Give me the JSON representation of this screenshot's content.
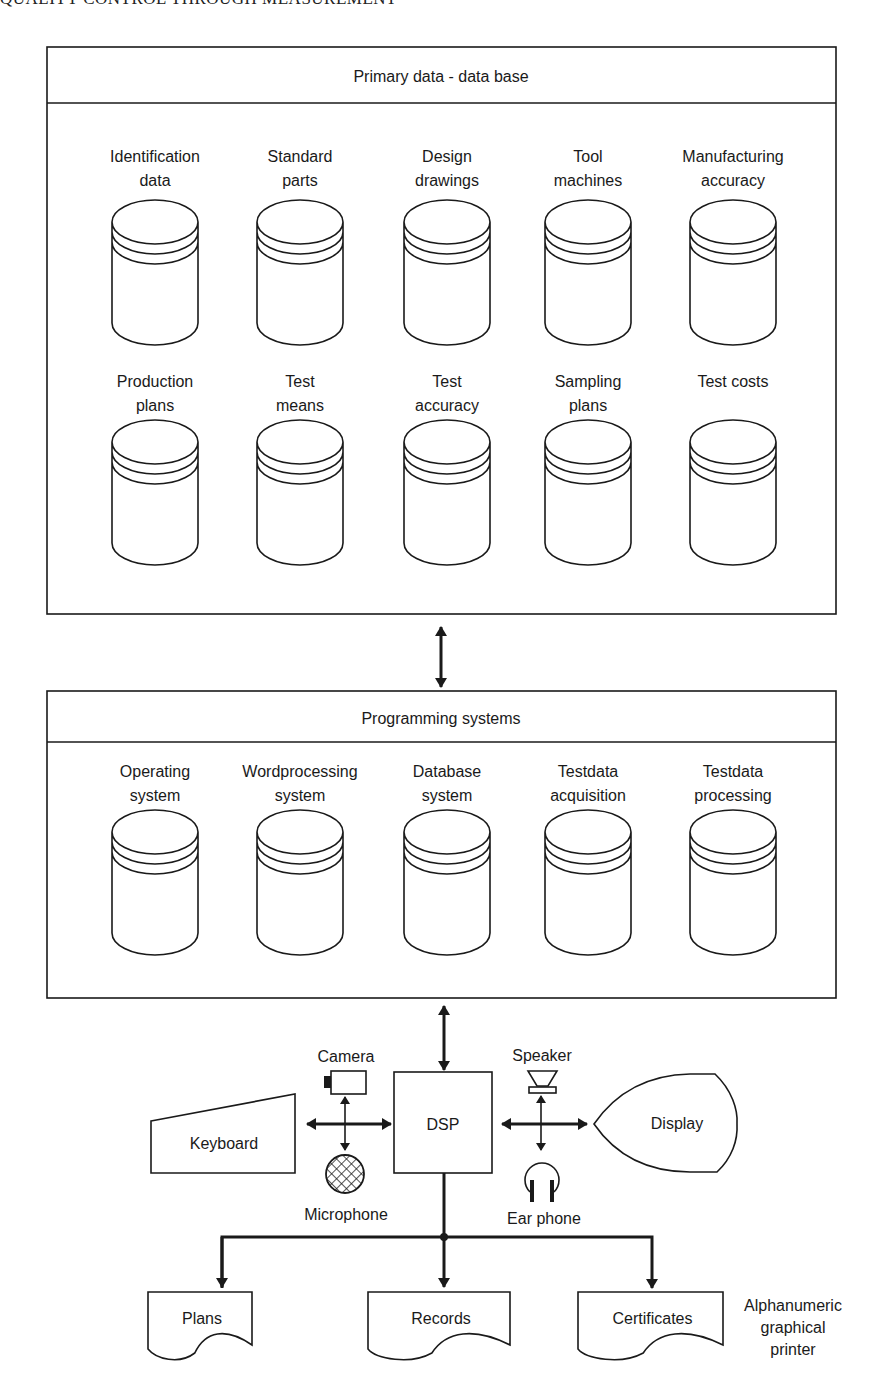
{
  "running_head": "QUALITY CONTROL THROUGH MEASUREMENT",
  "primary_database": {
    "title": "Primary data - data base",
    "row1": [
      {
        "lines": [
          "Identification",
          "data"
        ]
      },
      {
        "lines": [
          "Standard",
          "parts"
        ]
      },
      {
        "lines": [
          "Design",
          "drawings"
        ]
      },
      {
        "lines": [
          "Tool",
          "machines"
        ]
      },
      {
        "lines": [
          "Manufacturing",
          "accuracy"
        ]
      }
    ],
    "row2": [
      {
        "lines": [
          "Production",
          "plans"
        ]
      },
      {
        "lines": [
          "Test",
          "means"
        ]
      },
      {
        "lines": [
          "Test",
          "accuracy"
        ]
      },
      {
        "lines": [
          "Sampling",
          "plans"
        ]
      },
      {
        "lines": [
          "Test costs"
        ]
      }
    ]
  },
  "programming_systems": {
    "title": "Programming systems",
    "items": [
      {
        "lines": [
          "Operating",
          "system"
        ]
      },
      {
        "lines": [
          "Wordprocessing",
          "system"
        ]
      },
      {
        "lines": [
          "Database",
          "system"
        ]
      },
      {
        "lines": [
          "Testdata",
          "acquisition"
        ]
      },
      {
        "lines": [
          "Testdata",
          "processing"
        ]
      }
    ]
  },
  "hardware": {
    "dsp": "DSP",
    "camera": "Camera",
    "microphone": "Microphone",
    "keyboard": "Keyboard",
    "speaker": "Speaker",
    "ear_phone": "Ear phone",
    "display": "Display"
  },
  "outputs": {
    "documents": [
      "Plans",
      "Records",
      "Certificates"
    ],
    "printer_label": [
      "Alphanumeric",
      "graphical",
      "printer"
    ]
  },
  "icons": {
    "database": "cylinder-icon",
    "document": "document-shape",
    "camera": "camera-icon",
    "microphone": "microphone-icon",
    "speaker": "speaker-icon",
    "ear_phone": "headphones-icon"
  }
}
